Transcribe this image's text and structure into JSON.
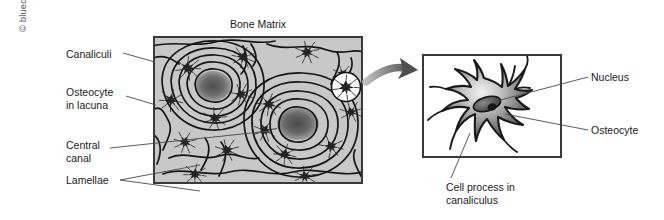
{
  "figure": {
    "copyright": "© bluedoor, LLC",
    "title": "Bone Matrix"
  },
  "labels": {
    "canaliculi": "Canaliculi",
    "osteocyte_in_lacuna": "Osteocyte\nin lacuna",
    "central_canal": "Central\ncanal",
    "lamellae": "Lamellae",
    "nucleus": "Nucleus",
    "osteocyte": "Osteocyte",
    "cell_process": "Cell process in\ncanaliculus"
  },
  "colors": {
    "matrix_background": "#c9c9c9",
    "lamellae_line": "#1a1a1a",
    "canal_dark": "#5f5f5f",
    "osteocyte_body": "#2b2b2b",
    "panel_border": "#3a3a3a",
    "leader_line": "#4a4a4a",
    "arrow": "#8c8c8c",
    "text": "#1a1a1a",
    "copyright_text": "#5a5a5a",
    "cell_fill_light": "#e8e8e8",
    "cell_fill_mid": "#8f8f8f",
    "cell_fill_dark": "#3d3d3d",
    "nucleus_fill": "#555555",
    "nucleolus_fill": "#1e1e1e"
  },
  "panels": {
    "bone_matrix": {
      "name": "Bone Matrix cross-section",
      "central_canals": [
        {
          "cx": 58,
          "cy": 48,
          "rx": 17,
          "ry": 14
        },
        {
          "cx": 143,
          "cy": 84,
          "rx": 20,
          "ry": 15
        }
      ],
      "lamellae_rings": 6,
      "osteocyte_count": 16
    },
    "osteocyte_detail": {
      "name": "Osteocyte magnified detail",
      "nucleus": {
        "cx": 63,
        "cy": 48,
        "rx": 14,
        "ry": 7
      },
      "processes": 11
    }
  },
  "magnifier": {
    "name": "magnifier-circle",
    "cx": 344,
    "cy": 85,
    "r": 14
  }
}
